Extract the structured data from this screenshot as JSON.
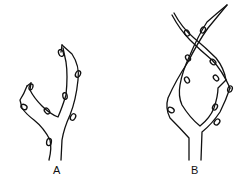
{
  "figure": {
    "panels": [
      {
        "id": "A",
        "label": "A",
        "description": "Twig with two diverging shoots bearing buds"
      },
      {
        "id": "B",
        "label": "B",
        "description": "Twig with two shoots that cross, forming a loop, bearing buds"
      }
    ],
    "colors": {
      "stroke": "#111111",
      "background": "#ffffff"
    }
  }
}
